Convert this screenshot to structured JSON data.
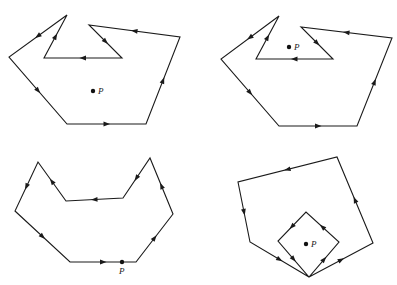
{
  "figure": {
    "panels": [
      {
        "id": "top-left",
        "point_label": "P",
        "point": [
          93,
          91
        ],
        "label_offset": [
          5,
          3
        ],
        "vertices": [
          [
            67,
            124
          ],
          [
            146,
            124
          ],
          [
            180,
            37
          ],
          [
            89,
            25
          ],
          [
            122,
            58
          ],
          [
            44,
            58
          ],
          [
            67,
            15
          ],
          [
            9,
            57
          ]
        ]
      },
      {
        "id": "top-right",
        "point_label": "P",
        "point": [
          289,
          47
        ],
        "label_offset": [
          5,
          3
        ],
        "vertices": [
          [
            279,
            126
          ],
          [
            357,
            126
          ],
          [
            392,
            38
          ],
          [
            301,
            27
          ],
          [
            333,
            59
          ],
          [
            256,
            59
          ],
          [
            279,
            16
          ],
          [
            221,
            59
          ]
        ]
      },
      {
        "id": "bottom-left",
        "point_label": "P",
        "point": [
          122,
          262
        ],
        "label_offset": [
          -3,
          12
        ],
        "vertices": [
          [
            70,
            262
          ],
          [
            136,
            262
          ],
          [
            173,
            214
          ],
          [
            150,
            158
          ],
          [
            123,
            198
          ],
          [
            66,
            201
          ],
          [
            38,
            162
          ],
          [
            15,
            211
          ]
        ]
      },
      {
        "id": "bottom-right",
        "point_label": "P",
        "point": [
          306,
          244
        ],
        "label_offset": [
          5,
          3
        ],
        "vertices": [
          [
            309,
            277
          ],
          [
            373,
            243
          ],
          [
            337,
            157
          ],
          [
            238,
            182
          ],
          [
            250,
            242
          ],
          [
            309,
            277
          ],
          [
            339,
            242
          ],
          [
            306,
            212
          ],
          [
            278,
            241
          ]
        ]
      }
    ]
  }
}
